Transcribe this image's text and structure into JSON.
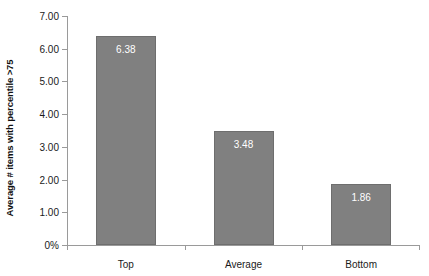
{
  "chart_data": {
    "type": "bar",
    "title": "",
    "xlabel": "",
    "ylabel": "Average # items with percentile >75",
    "categories": [
      "Top",
      "Average",
      "Bottom"
    ],
    "values": [
      6.38,
      1.86,
      3.48
    ],
    "value_labels": [
      "6.38",
      "3.48",
      "1.86"
    ],
    "ylim": [
      0,
      7
    ],
    "ytick_values": [
      0,
      1,
      2,
      3,
      4,
      5,
      6,
      7
    ],
    "ytick_labels": [
      "0%",
      "1.00",
      "2.00",
      "3.00",
      "4.00",
      "5.00",
      "6.00",
      "7.00"
    ],
    "grid": false,
    "legend": false,
    "bar_color": "#808080",
    "bar_edge_color": "#6e6e6e",
    "value_label_color": "#ffffff",
    "axis_color": "#9a9a9a",
    "series": [
      {
        "name": "Average # items with percentile >75",
        "values": [
          6.38,
          3.48,
          1.86
        ]
      }
    ]
  }
}
